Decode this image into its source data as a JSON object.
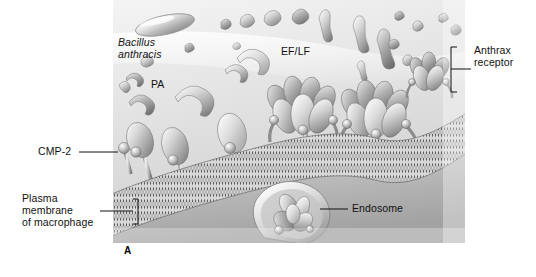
{
  "figure": {
    "panel_letter": "A",
    "type": "grayscale scientific illustration"
  },
  "labels": {
    "bacillus": "Bacillus\nanthracis",
    "bacillus_line1": "Bacillus",
    "bacillus_line2": "anthracis",
    "pa": "PA",
    "ef_lf": "EF/LF",
    "anthrax_receptor_line1": "Anthrax",
    "anthrax_receptor_line2": "receptor",
    "cmp2": "CMP-2",
    "plasma_membrane_line1": "Plasma",
    "plasma_membrane_line2": "membrane",
    "plasma_membrane_line3": "of macrophage",
    "endosome": "Endosome"
  },
  "colors": {
    "ink": "#111111",
    "page": "#ffffff",
    "cytosol_light": "#e9e9e9",
    "cytosol_mid": "#cfcfcf",
    "cytosol_dark": "#9a9a9a",
    "protein_light": "#f2f2f2",
    "protein_mid": "#b8b8b8",
    "protein_dark": "#6e6e6e",
    "membrane": "#8f8f8f"
  },
  "scene": {
    "bacterium": {
      "name": "Bacillus anthracis rod",
      "count": 1
    },
    "pa_monomers": {
      "name": "PA monomer",
      "count": 9
    },
    "ef_lf_molecules": {
      "name": "EF/LF molecule",
      "count": 14
    },
    "receptor_bound_pa": {
      "name": "PA bound to anthrax receptor",
      "count": 4
    },
    "heptamer_pores": {
      "name": "PA heptamer prepore/pore",
      "count": 3
    },
    "cmp2_inhibitor": {
      "name": "CMP-2 small molecule",
      "count": 1
    },
    "endosome": {
      "name": "Endosome vesicle with internalized toxin",
      "count": 1
    },
    "membrane": {
      "name": "Lipid bilayer plasma membrane of macrophage"
    }
  }
}
